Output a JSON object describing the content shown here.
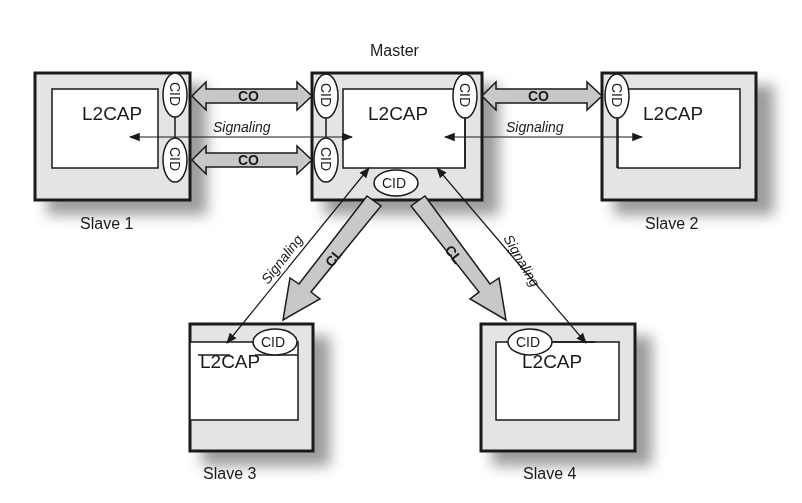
{
  "diagram": {
    "title": "Master",
    "colors": {
      "outer_box_fill": "#e4e4e4",
      "inner_box_fill": "#ffffff",
      "stroke": "#1a1a1a",
      "channel_arrow_fill": "#c8c8c8",
      "shadow": "#8a8a8a"
    },
    "nodes": {
      "master": {
        "label": "Master",
        "layer": "L2CAP"
      },
      "slave1": {
        "label": "Slave 1",
        "layer": "L2CAP"
      },
      "slave2": {
        "label": "Slave 2",
        "layer": "L2CAP"
      },
      "slave3": {
        "label": "Slave 3",
        "layer": "L2CAP"
      },
      "slave4": {
        "label": "Slave 4",
        "layer": "L2CAP"
      }
    },
    "endpoint_label": "CID",
    "links": {
      "co_label": "CO",
      "cl_label": "CL",
      "signaling_label": "Signaling"
    },
    "edges": [
      {
        "from": "slave1",
        "to": "master",
        "type": "CO",
        "direction": "bidirectional"
      },
      {
        "from": "slave1",
        "to": "master",
        "type": "CO",
        "direction": "bidirectional"
      },
      {
        "from": "slave1",
        "to": "master",
        "type": "Signaling",
        "direction": "bidirectional"
      },
      {
        "from": "master",
        "to": "slave2",
        "type": "CO",
        "direction": "bidirectional"
      },
      {
        "from": "master",
        "to": "slave2",
        "type": "Signaling",
        "direction": "bidirectional"
      },
      {
        "from": "master",
        "to": "slave3",
        "type": "CL",
        "direction": "unidirectional"
      },
      {
        "from": "master",
        "to": "slave3",
        "type": "Signaling",
        "direction": "bidirectional"
      },
      {
        "from": "master",
        "to": "slave4",
        "type": "CL",
        "direction": "unidirectional"
      },
      {
        "from": "master",
        "to": "slave4",
        "type": "Signaling",
        "direction": "bidirectional"
      }
    ]
  }
}
